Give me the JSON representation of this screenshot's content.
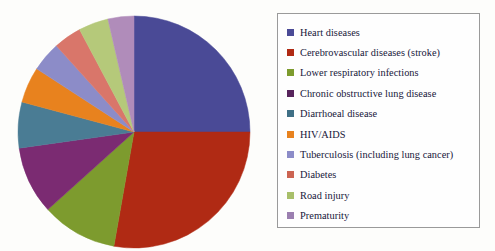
{
  "chart_data": {
    "type": "pie",
    "title": "",
    "subtitle": "",
    "xlabel": "",
    "ylabel": "",
    "legend_position": "right",
    "grid": false,
    "start_angle_deg": 0,
    "direction": "clockwise",
    "categories": [
      "Heart diseases",
      "Cerebrovascular diseases (stroke)",
      "Lower respiratory infections",
      "Chronic obstructive lung disease",
      "Diarrhoeal disease",
      "HIV/AIDS",
      "Tuberculosis (including lung cancer)",
      "Diabetes",
      "Road injury",
      "Prematurity"
    ],
    "values": [
      25,
      27.8,
      10.6,
      9.4,
      6.4,
      5,
      4.2,
      3.9,
      4.2,
      3.5
    ],
    "colors": [
      "#4a4a96",
      "#b02a14",
      "#7d9b2e",
      "#7b2b72",
      "#4a7c94",
      "#e8821e",
      "#8c8cc8",
      "#d9766a",
      "#b5c97a",
      "#b08cba"
    ],
    "slices": [
      {
        "label": "Heart diseases",
        "value": 25.0,
        "color": "#4a4a96",
        "start_deg": 0.0,
        "end_deg": 90.0
      },
      {
        "label": "Cerebrovascular diseases (stroke)",
        "value": 27.8,
        "color": "#b02a14",
        "start_deg": 90.0,
        "end_deg": 190.0
      },
      {
        "label": "Lower respiratory infections",
        "value": 10.6,
        "color": "#7d9b2e",
        "start_deg": 190.0,
        "end_deg": 228.0
      },
      {
        "label": "Chronic obstructive lung disease",
        "value": 9.4,
        "color": "#7b2b72",
        "start_deg": 228.0,
        "end_deg": 262.0
      },
      {
        "label": "Diarrhoeal disease",
        "value": 6.4,
        "color": "#4a7c94",
        "start_deg": 262.0,
        "end_deg": 285.0
      },
      {
        "label": "HIV/AIDS",
        "value": 5.0,
        "color": "#e8821e",
        "start_deg": 285.0,
        "end_deg": 303.0
      },
      {
        "label": "Tuberculosis (including lung cancer)",
        "value": 4.2,
        "color": "#8c8cc8",
        "start_deg": 303.0,
        "end_deg": 318.0
      },
      {
        "label": "Diabetes",
        "value": 3.9,
        "color": "#d9766a",
        "start_deg": 318.0,
        "end_deg": 332.0
      },
      {
        "label": "Road injury",
        "value": 4.2,
        "color": "#b5c97a",
        "start_deg": 332.0,
        "end_deg": 347.0
      },
      {
        "label": "Prematurity",
        "value": 3.5,
        "color": "#b08cba",
        "start_deg": 347.0,
        "end_deg": 360.0
      }
    ]
  },
  "legend": {
    "items": [
      {
        "label": "Heart diseases",
        "color": "#4a4a96"
      },
      {
        "label": "Cerebrovascular diseases (stroke)",
        "color": "#b02a14"
      },
      {
        "label": "Lower respiratory infections",
        "color": "#7d9b2e"
      },
      {
        "label": "Chronic obstructive lung disease",
        "color": "#57245c"
      },
      {
        "label": "Diarrhoeal disease",
        "color": "#3f6f85"
      },
      {
        "label": "HIV/AIDS",
        "color": "#e8821e"
      },
      {
        "label": "Tuberculosis (including lung cancer)",
        "color": "#8c8cc8"
      },
      {
        "label": "Diabetes",
        "color": "#cc6452"
      },
      {
        "label": "Road injury",
        "color": "#a8bf6a"
      },
      {
        "label": "Prematurity",
        "color": "#9b7fb0"
      }
    ]
  }
}
